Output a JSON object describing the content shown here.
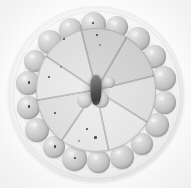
{
  "image": {
    "kind": "photograph",
    "color_mode": "grayscale",
    "subject": "round plate of sliced fruit arranged radially, ringed by spherical garnish balls",
    "width": 191,
    "height": 188,
    "background_color": "#ffffff",
    "caption": ""
  },
  "palette": {
    "background": "#ffffff",
    "plate_light": "#f6f6f6",
    "plate_edge": "#dcdcdc",
    "plate_well": "#f2f2f2",
    "wedge_light": "#e8e8e8",
    "wedge_mid": "#d8d8d8",
    "wedge_dark": "#c2c2c2",
    "ball_light": "#dcdcdc",
    "ball_mid": "#c6c6c6",
    "ball_shadow": "#9a9a9a",
    "seed_dark": "#2e2e2e",
    "core_dark": "#4f4f4f"
  },
  "plate": {
    "center_x": 96,
    "center_y": 94,
    "outer_radius": 88,
    "rim_radius": 83,
    "well_radius": 76
  },
  "fruit_disc": {
    "center_x": 96,
    "center_y": 90,
    "radius_x": 60,
    "radius_y": 62,
    "wedge_count": 8,
    "wedges": [
      {
        "index": 0,
        "start_angle_deg": -104,
        "sweep_deg": 44,
        "tone": "dark",
        "seed_count": 14
      },
      {
        "index": 1,
        "start_angle_deg": -60,
        "sweep_deg": 46,
        "tone": "dark",
        "seed_count": 11
      },
      {
        "index": 2,
        "start_angle_deg": -14,
        "sweep_deg": 46,
        "tone": "mid",
        "seed_count": 6
      },
      {
        "index": 3,
        "start_angle_deg": 32,
        "sweep_deg": 46,
        "tone": "light",
        "seed_count": 9
      },
      {
        "index": 4,
        "start_angle_deg": 78,
        "sweep_deg": 46,
        "tone": "light",
        "seed_count": 7
      },
      {
        "index": 5,
        "start_angle_deg": 124,
        "sweep_deg": 46,
        "tone": "mid",
        "seed_count": 5
      },
      {
        "index": 6,
        "start_angle_deg": 170,
        "sweep_deg": 44,
        "tone": "light",
        "seed_count": 8
      },
      {
        "index": 7,
        "start_angle_deg": 214,
        "sweep_deg": 42,
        "tone": "mid",
        "seed_count": 6
      }
    ],
    "core": {
      "x": 96,
      "y": 90,
      "width": 11,
      "height": 30,
      "tone": "#4f4f4f"
    },
    "inner_balls": [
      {
        "x": 84,
        "y": 100,
        "size": 15
      },
      {
        "x": 101,
        "y": 100,
        "size": 16
      },
      {
        "x": 109,
        "y": 82,
        "size": 11
      }
    ]
  },
  "garnish_ring": {
    "count": 18,
    "radius": 69,
    "center_x": 96,
    "center_y": 93,
    "balls": [
      {
        "index": 0,
        "angle_deg": -92,
        "size": 25,
        "has_speck": true
      },
      {
        "index": 1,
        "angle_deg": -72,
        "size": 22,
        "has_speck": false
      },
      {
        "index": 2,
        "angle_deg": -52,
        "size": 24,
        "has_speck": false
      },
      {
        "index": 3,
        "angle_deg": -32,
        "size": 23,
        "has_speck": false
      },
      {
        "index": 4,
        "angle_deg": -12,
        "size": 25,
        "has_speck": false
      },
      {
        "index": 5,
        "angle_deg": 8,
        "size": 23,
        "has_speck": false
      },
      {
        "index": 6,
        "angle_deg": 28,
        "size": 24,
        "has_speck": false
      },
      {
        "index": 7,
        "angle_deg": 48,
        "size": 22,
        "has_speck": false
      },
      {
        "index": 8,
        "angle_deg": 68,
        "size": 24,
        "has_speck": false
      },
      {
        "index": 9,
        "angle_deg": 88,
        "size": 23,
        "has_speck": false
      },
      {
        "index": 10,
        "angle_deg": 108,
        "size": 25,
        "has_speck": true
      },
      {
        "index": 11,
        "angle_deg": 128,
        "size": 22,
        "has_speck": true
      },
      {
        "index": 12,
        "angle_deg": 148,
        "size": 24,
        "has_speck": false
      },
      {
        "index": 13,
        "angle_deg": 168,
        "size": 23,
        "has_speck": true
      },
      {
        "index": 14,
        "angle_deg": 188,
        "size": 24,
        "has_speck": true
      },
      {
        "index": 15,
        "angle_deg": 208,
        "size": 22,
        "has_speck": false
      },
      {
        "index": 16,
        "angle_deg": 228,
        "size": 24,
        "has_speck": false
      },
      {
        "index": 17,
        "angle_deg": 248,
        "size": 23,
        "has_speck": false
      }
    ]
  },
  "seeds": [
    {
      "wedge": 0,
      "x": 52,
      "y": 18,
      "size": 2.2
    },
    {
      "wedge": 0,
      "x": 60,
      "y": 26,
      "size": 1.8
    },
    {
      "wedge": 0,
      "x": 68,
      "y": 14,
      "size": 2.6
    },
    {
      "wedge": 0,
      "x": 74,
      "y": 30,
      "size": 2.0
    },
    {
      "wedge": 0,
      "x": 63,
      "y": 38,
      "size": 2.4
    },
    {
      "wedge": 0,
      "x": 80,
      "y": 22,
      "size": 1.6
    },
    {
      "wedge": 1,
      "x": 88,
      "y": 26,
      "size": 2.4
    },
    {
      "wedge": 1,
      "x": 96,
      "y": 34,
      "size": 2.0
    },
    {
      "wedge": 1,
      "x": 104,
      "y": 22,
      "size": 2.6
    },
    {
      "wedge": 1,
      "x": 99,
      "y": 44,
      "size": 1.8
    },
    {
      "wedge": 3,
      "x": 86,
      "y": 128,
      "size": 2.2
    },
    {
      "wedge": 3,
      "x": 94,
      "y": 136,
      "size": 2.6
    },
    {
      "wedge": 3,
      "x": 78,
      "y": 140,
      "size": 1.8
    },
    {
      "wedge": 5,
      "x": 54,
      "y": 112,
      "size": 2.0
    },
    {
      "wedge": 6,
      "x": 48,
      "y": 76,
      "size": 2.4
    },
    {
      "wedge": 6,
      "x": 60,
      "y": 66,
      "size": 1.8
    }
  ]
}
